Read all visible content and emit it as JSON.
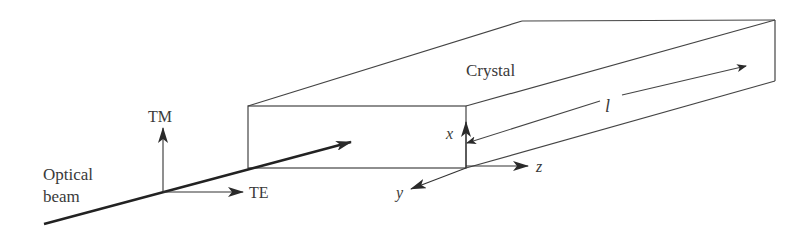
{
  "diagram": {
    "type": "crystal-optical-beam-geometry",
    "colors": {
      "line": "#444444",
      "beam": "#222222",
      "text": "#3a3a3a",
      "background": "#ffffff"
    },
    "labels": {
      "crystal": "Crystal",
      "length": "l",
      "axis_x": "x",
      "axis_y": "y",
      "axis_z": "z",
      "tm": "TM",
      "te": "TE",
      "beam_line1": "Optical",
      "beam_line2": "beam"
    }
  }
}
